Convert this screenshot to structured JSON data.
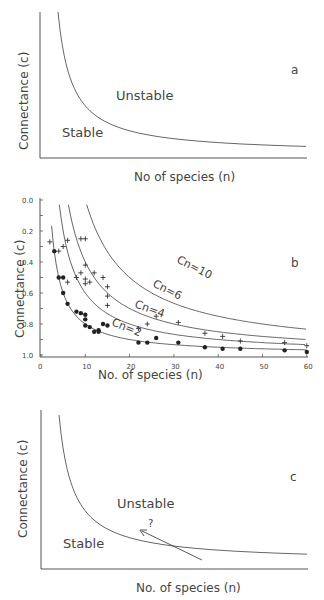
{
  "chart_data": [
    {
      "panel": "a",
      "type": "line",
      "title": "",
      "xlabel": "No of species (n)",
      "ylabel": "Connectance (c)",
      "annotations": [
        "Unstable",
        "Stable",
        "a"
      ],
      "series": [
        {
          "name": "stability boundary",
          "shape": "hyperbola c ~ k/n"
        }
      ],
      "grid": false
    },
    {
      "panel": "b",
      "type": "scatter",
      "xlabel": "No. of species (n)",
      "ylabel": "Connectance (c)",
      "xlim": [
        0,
        60
      ],
      "ylim": [
        0,
        1.0
      ],
      "x_ticks": [
        "0",
        "10",
        "20",
        "30",
        "40",
        "50",
        "60"
      ],
      "y_ticks": [
        "0.0",
        "0.2",
        "0.4",
        "0.6",
        "0.8",
        "1.0"
      ],
      "grid": false,
      "annotations": [
        "b"
      ],
      "curves": [
        {
          "name": "Cn=2",
          "k": 2
        },
        {
          "name": "Cn=4",
          "k": 4
        },
        {
          "name": "Cn=6",
          "k": 6
        },
        {
          "name": "Cn=10",
          "k": 10
        }
      ],
      "series": [
        {
          "name": "dots",
          "marker": "circle",
          "points": [
            [
              3,
              0.67
            ],
            [
              4,
              0.5
            ],
            [
              5,
              0.5
            ],
            [
              5,
              0.4
            ],
            [
              6,
              0.33
            ],
            [
              8,
              0.28
            ],
            [
              9,
              0.27
            ],
            [
              10,
              0.26
            ],
            [
              10,
              0.23
            ],
            [
              10,
              0.19
            ],
            [
              11,
              0.18
            ],
            [
              12,
              0.15
            ],
            [
              13,
              0.16
            ],
            [
              13,
              0.15
            ],
            [
              14,
              0.2
            ],
            [
              15,
              0.19
            ],
            [
              22,
              0.08
            ],
            [
              24,
              0.08
            ],
            [
              26,
              0.11
            ],
            [
              31,
              0.08
            ],
            [
              37,
              0.05
            ],
            [
              41,
              0.04
            ],
            [
              45,
              0.04
            ],
            [
              55,
              0.03
            ],
            [
              60,
              0.02
            ]
          ]
        },
        {
          "name": "crosses",
          "marker": "plus",
          "points": [
            [
              2,
              0.73
            ],
            [
              4,
              0.67
            ],
            [
              5,
              0.7
            ],
            [
              6,
              0.74
            ],
            [
              6,
              0.47
            ],
            [
              8,
              0.5
            ],
            [
              9,
              0.53
            ],
            [
              9,
              0.75
            ],
            [
              10,
              0.75
            ],
            [
              10,
              0.58
            ],
            [
              10,
              0.49
            ],
            [
              10,
              0.46
            ],
            [
              11,
              0.47
            ],
            [
              12,
              0.53
            ],
            [
              14,
              0.5
            ],
            [
              15,
              0.44
            ],
            [
              15,
              0.38
            ],
            [
              15,
              0.32
            ],
            [
              22,
              0.17
            ],
            [
              24,
              0.2
            ],
            [
              26,
              0.25
            ],
            [
              31,
              0.21
            ],
            [
              37,
              0.14
            ],
            [
              41,
              0.12
            ],
            [
              45,
              0.09
            ],
            [
              55,
              0.08
            ],
            [
              60,
              0.06
            ]
          ]
        }
      ]
    },
    {
      "panel": "c",
      "type": "line",
      "xlabel": "No. of species (n)",
      "ylabel": "Connectance (c)",
      "annotations": [
        "Unstable",
        "Stable",
        "?",
        "c"
      ],
      "series": [
        {
          "name": "stability boundary",
          "shape": "hyperbola"
        },
        {
          "name": "arrow",
          "shape": "arrow crossing boundary toward upper-left"
        }
      ],
      "grid": false
    }
  ],
  "panel_a": {
    "ylabel": "Connectance (c)",
    "xlabel": "No of species (n)",
    "unstable": "Unstable",
    "stable": "Stable",
    "letter": "a"
  },
  "panel_b": {
    "ylabel": "Connectance (c)",
    "xlabel": "No. of species (n)",
    "letter": "b",
    "y_ticks": [
      "1.0",
      "0.8",
      "0.6",
      "0.4",
      "0.2",
      "0.0"
    ],
    "x_ticks": [
      "0",
      "10",
      "20",
      "30",
      "40",
      "50",
      "60"
    ],
    "curve_labels": [
      "Cn=10",
      "Cn=6",
      "Cn=4",
      "Cn=2"
    ]
  },
  "panel_c": {
    "ylabel": "Connectance (c)",
    "xlabel": "No. of species (n)",
    "unstable": "Unstable",
    "stable": "Stable",
    "question": "?",
    "letter": "c"
  }
}
